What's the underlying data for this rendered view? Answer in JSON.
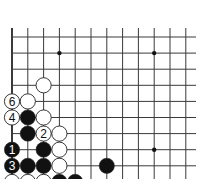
{
  "diagram": {
    "type": "go-board-corner",
    "region": "lower-left corner",
    "colors": {
      "background": "#ffffff",
      "line": "#3a3a3a",
      "black_stone": "#111111",
      "white_stone": "#ffffff",
      "star_point": "#111111"
    },
    "grid": {
      "origin_x": 12,
      "origin_y": 37,
      "col_spacing": 15.8,
      "row_spacing": 16.1,
      "columns": 12,
      "rows": 10,
      "line_top": 28,
      "line_right": 196,
      "left_edge_is_board_edge": true
    },
    "star_points": [
      {
        "col": 3,
        "row": 1
      },
      {
        "col": 9,
        "row": 1
      },
      {
        "col": 9,
        "row": 7
      }
    ],
    "stones": [
      {
        "col": 2,
        "row": 3,
        "color": "white",
        "label": ""
      },
      {
        "col": 0,
        "row": 4,
        "color": "white",
        "label": "6"
      },
      {
        "col": 1,
        "row": 4,
        "color": "white",
        "label": ""
      },
      {
        "col": 0,
        "row": 5,
        "color": "white",
        "label": "4"
      },
      {
        "col": 1,
        "row": 5,
        "color": "black",
        "label": ""
      },
      {
        "col": 2,
        "row": 5,
        "color": "white",
        "label": ""
      },
      {
        "col": 1,
        "row": 6,
        "color": "black",
        "label": ""
      },
      {
        "col": 2,
        "row": 6,
        "color": "white",
        "label": "2"
      },
      {
        "col": 3,
        "row": 6,
        "color": "white",
        "label": ""
      },
      {
        "col": 0,
        "row": 7,
        "color": "black",
        "label": "1"
      },
      {
        "col": 2,
        "row": 7,
        "color": "black",
        "label": ""
      },
      {
        "col": 3,
        "row": 7,
        "color": "white",
        "label": ""
      },
      {
        "col": 0,
        "row": 8,
        "color": "black",
        "label": "3"
      },
      {
        "col": 1,
        "row": 8,
        "color": "black",
        "label": ""
      },
      {
        "col": 2,
        "row": 8,
        "color": "black",
        "label": ""
      },
      {
        "col": 3,
        "row": 8,
        "color": "white",
        "label": ""
      },
      {
        "col": 6,
        "row": 8,
        "color": "black",
        "label": ""
      },
      {
        "col": 0,
        "row": 9,
        "color": "white",
        "label": ""
      },
      {
        "col": 1,
        "row": 9,
        "color": "white",
        "label": ""
      },
      {
        "col": 2,
        "row": 9,
        "color": "white",
        "label": ""
      },
      {
        "col": 3,
        "row": 9,
        "color": "black",
        "label": ""
      },
      {
        "col": 4,
        "row": 9,
        "color": "black",
        "label": ""
      }
    ]
  }
}
